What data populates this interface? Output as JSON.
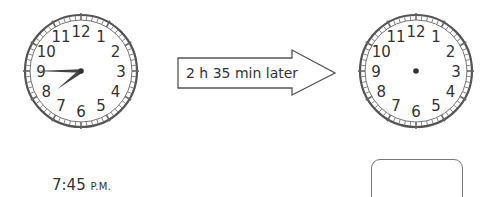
{
  "start_clock": {
    "center": [
      81,
      71
    ],
    "radius": 56,
    "numbers": [
      "12",
      "1",
      "2",
      "3",
      "4",
      "5",
      "6",
      "7",
      "8",
      "9",
      "10",
      "11"
    ],
    "hour_hand_angle_deg": 232.5,
    "minute_hand_angle_deg": 270,
    "time_shown": "7:45"
  },
  "arrow": {
    "label": "2 h 35 min later"
  },
  "end_clock": {
    "center": [
      416,
      71
    ],
    "radius": 56,
    "numbers": [
      "12",
      "1",
      "2",
      "3",
      "4",
      "5",
      "6",
      "7",
      "8",
      "9",
      "10",
      "11"
    ],
    "hands": "none"
  },
  "start_time": {
    "time": "7:45",
    "period": "P.M."
  },
  "answer_box": {
    "value": ""
  },
  "colors": {
    "rim": "#555555",
    "hands": "#444444",
    "text": "#333333"
  }
}
